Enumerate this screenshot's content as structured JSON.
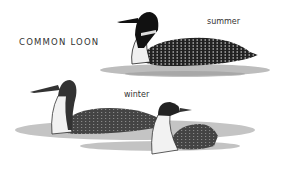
{
  "title": "COMMON LOON",
  "labels": {
    "summer": "summer",
    "winter": "winter"
  },
  "colors": {
    "ink": "#1a1a1a",
    "water": "#b8b8b8",
    "belly": "#f2f2f2",
    "background": "#ffffff"
  }
}
